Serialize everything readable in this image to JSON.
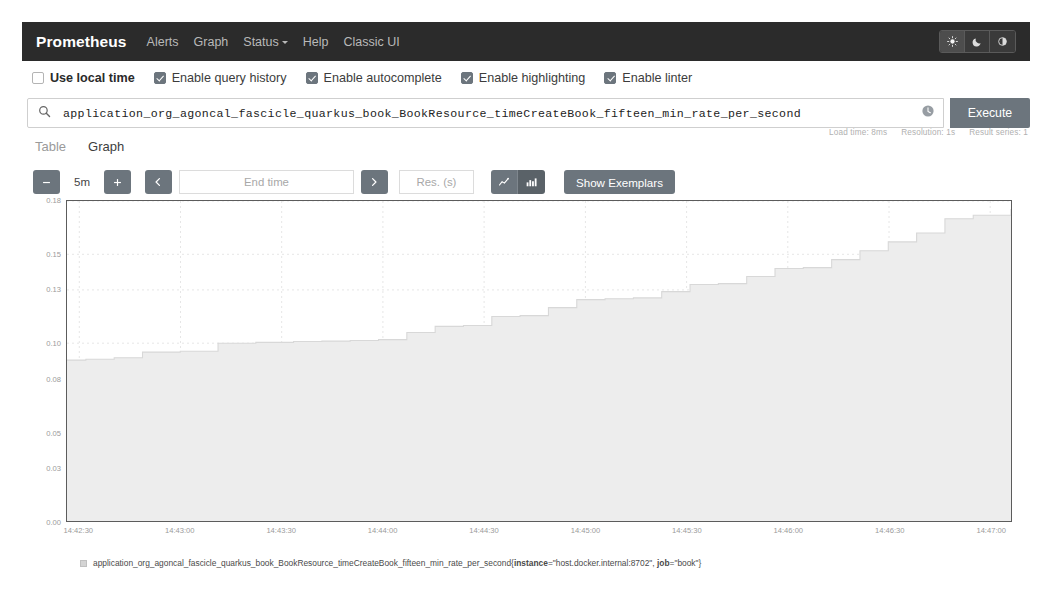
{
  "navbar": {
    "brand": "Prometheus",
    "links": [
      {
        "label": "Alerts",
        "has_caret": false
      },
      {
        "label": "Graph",
        "has_caret": false
      },
      {
        "label": "Status",
        "has_caret": true
      },
      {
        "label": "Help",
        "has_caret": false
      },
      {
        "label": "Classic UI",
        "has_caret": false
      }
    ],
    "theme": {
      "light_icon": "sun-icon",
      "dark_icon": "moon-icon",
      "auto_icon": "half-circle-icon",
      "active": "light"
    },
    "background": "#2b2b2b"
  },
  "options": [
    {
      "label": "Use local time",
      "checked": false,
      "strong": true
    },
    {
      "label": "Enable query history",
      "checked": true,
      "strong": false
    },
    {
      "label": "Enable autocomplete",
      "checked": true,
      "strong": false
    },
    {
      "label": "Enable highlighting",
      "checked": true,
      "strong": false
    },
    {
      "label": "Enable linter",
      "checked": true,
      "strong": false
    }
  ],
  "query": {
    "search_icon": "search-icon",
    "value": "application_org_agoncal_fascicle_quarkus_book_BookResource_timeCreateBook_fifteen_min_rate_per_second",
    "placeholder": "Expression (press Shift+Enter for newlines)",
    "history_icon": "history-clock-icon",
    "execute_label": "Execute"
  },
  "meta": {
    "load_time": "Load time: 8ms",
    "resolution": "Resolution: 1s",
    "result_series": "Result series: 1"
  },
  "tabs": [
    {
      "label": "Table",
      "active": false
    },
    {
      "label": "Graph",
      "active": true
    }
  ],
  "controls": {
    "decrease_icon": "minus-icon",
    "range_value": "5m",
    "increase_icon": "plus-icon",
    "prev_icon": "chevron-left-icon",
    "end_time_placeholder": "End time",
    "end_time_value": "",
    "next_icon": "chevron-right-icon",
    "resolution_placeholder": "Res. (s)",
    "resolution_value": "",
    "line_chart_icon": "line-chart-icon",
    "stacked_chart_icon": "bar-chart-icon",
    "chart_mode": "stacked",
    "exemplars_label": "Show Exemplars"
  },
  "legend": {
    "metric": "application_org_agoncal_fascicle_quarkus_book_BookResource_timeCreateBook_fifteen_min_rate_per_second",
    "open_brace": "{",
    "label_instance_key": "instance",
    "label_instance_value": "=\"host.docker.internal:8702\", ",
    "label_job_key": "job",
    "label_job_value": "=\"book\"",
    "close_brace": "}",
    "color": "#d4d4d4"
  },
  "chart_data": {
    "type": "area",
    "title": "",
    "xlabel": "",
    "ylabel": "",
    "series_name": "application_org_agoncal_fascicle_quarkus_book_BookResource_timeCreateBook_fifteen_min_rate_per_second",
    "fill_color": "#ededed",
    "line_color": "#d8d8d8",
    "grid": true,
    "ylim": [
      0.0,
      0.18
    ],
    "y_ticks": [
      0.0,
      0.03,
      0.05,
      0.08,
      0.1,
      0.13,
      0.15,
      0.18
    ],
    "y_tick_labels": [
      "0.00",
      "0.03",
      "0.05",
      "0.08",
      "0.10",
      "0.13",
      "0.15",
      "0.18"
    ],
    "x_ticks": [
      "14:42:30",
      "14:43:00",
      "14:43:30",
      "14:44:00",
      "14:44:30",
      "14:45:00",
      "14:45:30",
      "14:46:00",
      "14:46:30",
      "14:47:00"
    ],
    "xlim": [
      "14:42:22",
      "14:47:18"
    ],
    "x": [
      0,
      2,
      5,
      8,
      12,
      16,
      20,
      24,
      27,
      30,
      33,
      36,
      39,
      42,
      45,
      48,
      51,
      54,
      57,
      60,
      63,
      66,
      69,
      72,
      75,
      78,
      81,
      84,
      87,
      90,
      93,
      96,
      100
    ],
    "values": [
      0.0905,
      0.091,
      0.0918,
      0.095,
      0.0955,
      0.1,
      0.1005,
      0.101,
      0.1012,
      0.1015,
      0.102,
      0.106,
      0.1095,
      0.11,
      0.115,
      0.1155,
      0.12,
      0.1245,
      0.125,
      0.1255,
      0.129,
      0.133,
      0.1335,
      0.1375,
      0.142,
      0.1425,
      0.147,
      0.152,
      0.157,
      0.162,
      0.17,
      0.172,
      0.1755
    ]
  }
}
